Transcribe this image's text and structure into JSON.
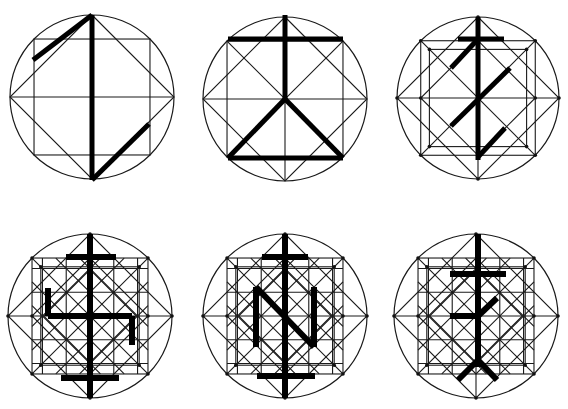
{
  "figure": {
    "colors": {
      "background": "#ffffff",
      "line": "#1a1a1a",
      "glyph": "#000000"
    },
    "panels": [
      {
        "id": "panel-1",
        "cx": 92,
        "cy": 97,
        "r": 82,
        "grid": "square-diamond",
        "glyph_name": "zigzag-rune",
        "glyph_width": 5,
        "glyph": [
          [
            33,
            60,
            92,
            15
          ],
          [
            92,
            15,
            92,
            180
          ],
          [
            92,
            180,
            149,
            124
          ]
        ]
      },
      {
        "id": "panel-2",
        "cx": 285,
        "cy": 99,
        "r": 82,
        "grid": "square-cross",
        "glyph_name": "cross-triangle-rune",
        "glyph_width": 5,
        "glyph": [
          [
            285,
            15,
            285,
            99
          ],
          [
            228,
            39,
            343,
            39
          ],
          [
            285,
            99,
            228,
            158
          ],
          [
            285,
            99,
            343,
            158
          ],
          [
            228,
            158,
            343,
            158
          ]
        ]
      },
      {
        "id": "panel-3",
        "cx": 478,
        "cy": 98,
        "r": 81,
        "grid": "double-square-diamond",
        "glyph_name": "bound-rune-z",
        "glyph_width": 5,
        "glyph": [
          [
            478,
            17,
            478,
            160
          ],
          [
            458,
            39,
            504,
            39
          ],
          [
            478,
            39,
            451,
            68
          ],
          [
            510,
            68,
            451,
            126
          ],
          [
            505,
            128,
            478,
            157
          ]
        ]
      },
      {
        "id": "panel-4",
        "cx": 90,
        "cy": 316,
        "r": 82,
        "grid": "dense-lattice",
        "glyph_name": "sun-wheel-rune",
        "glyph_width": 6,
        "glyph": [
          [
            90,
            234,
            90,
            398
          ],
          [
            66,
            257,
            116,
            257
          ],
          [
            61,
            378,
            119,
            378
          ],
          [
            48,
            288,
            48,
            316
          ],
          [
            48,
            316,
            132,
            316
          ],
          [
            132,
            316,
            132,
            345
          ]
        ]
      },
      {
        "id": "panel-5",
        "cx": 285,
        "cy": 316,
        "r": 82,
        "grid": "dense-lattice",
        "glyph_name": "n-bind-rune",
        "glyph_width": 6,
        "glyph": [
          [
            285,
            234,
            285,
            398
          ],
          [
            262,
            257,
            308,
            257
          ],
          [
            257,
            376,
            315,
            376
          ],
          [
            256,
            287,
            256,
            347
          ],
          [
            256,
            287,
            314,
            347
          ],
          [
            314,
            287,
            314,
            347
          ]
        ]
      },
      {
        "id": "panel-6",
        "cx": 476,
        "cy": 316,
        "r": 82,
        "grid": "dense-lattice",
        "glyph_name": "branch-cross-rune",
        "glyph_width": 6,
        "glyph": [
          [
            478,
            234,
            478,
            367
          ],
          [
            450,
            274,
            506,
            274
          ],
          [
            450,
            316,
            478,
            316
          ],
          [
            478,
            316,
            497,
            298
          ],
          [
            478,
            360,
            458,
            380
          ],
          [
            478,
            360,
            497,
            380
          ]
        ]
      }
    ]
  }
}
